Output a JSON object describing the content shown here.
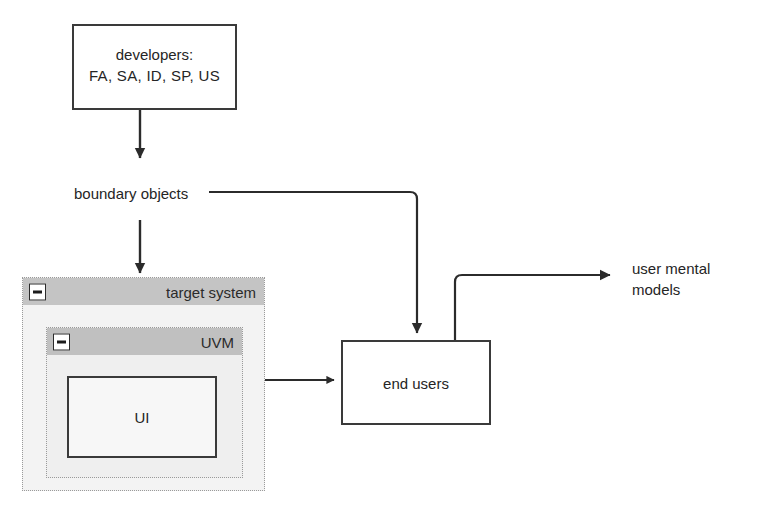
{
  "diagram": {
    "developers_box": {
      "line1": "developers:",
      "line2": "FA, SA, ID, SP, US"
    },
    "boundary_objects_label": "boundary objects",
    "target_system": {
      "title": "target system",
      "collapse_icon": "minus-icon"
    },
    "uvm": {
      "title": "UVM",
      "collapse_icon": "minus-icon"
    },
    "ui_box": {
      "label": "UI"
    },
    "end_users_box": {
      "label": "end users"
    },
    "user_mental_models_label": {
      "line1": "user mental",
      "line2": "models"
    }
  }
}
